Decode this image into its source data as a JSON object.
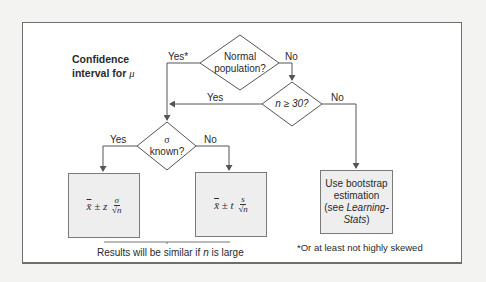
{
  "diagram": {
    "title_line1": "Confidence",
    "title_line2": "interval for",
    "title_symbol": "μ",
    "nodes": {
      "normal": {
        "line1": "Normal",
        "line2": "population?"
      },
      "n30": {
        "text": "n ≥ 30?"
      },
      "sigma": {
        "line1": "σ",
        "line2": "known?"
      },
      "zbox": {
        "xbar": "x̄",
        "op": " ± z ",
        "num": "σ",
        "den": "√n"
      },
      "tbox": {
        "xbar": "x̄",
        "op": " ± t ",
        "num": "s",
        "den": "√n"
      },
      "bootstrap": {
        "line1": "Use bootstrap",
        "line2": "estimation",
        "line3_pre": "(see ",
        "line3_it": "Learning-",
        "line4_it": "Stats",
        "line4_post": ")"
      }
    },
    "edges": {
      "normal_yes": "Yes*",
      "normal_no": "No",
      "n30_yes": "Yes",
      "n30_no": "No",
      "sigma_yes": "Yes",
      "sigma_no": "No"
    },
    "note_similar_pre": "Results will be similar if ",
    "note_similar_n": "n",
    "note_similar_post": " is large",
    "footnote": "*Or at least not highly skewed"
  },
  "colors": {
    "box_fill": "#eeeeee",
    "line": "#555555",
    "background": "#f3f3f1"
  }
}
